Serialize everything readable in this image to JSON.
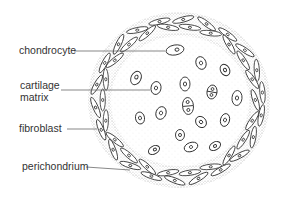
{
  "diagram": {
    "labels": [
      {
        "id": "chondrocyte",
        "text": "chondrocyte"
      },
      {
        "id": "cartilage_matrix",
        "line1": "cartilage",
        "line2": "matrix"
      },
      {
        "id": "fibroblast",
        "text": "fibroblast"
      },
      {
        "id": "perichondrium",
        "text": "perichondrium"
      }
    ]
  },
  "colors": {
    "ink": "#333333",
    "stipple": "#9a9a9a",
    "background": "#ffffff"
  }
}
